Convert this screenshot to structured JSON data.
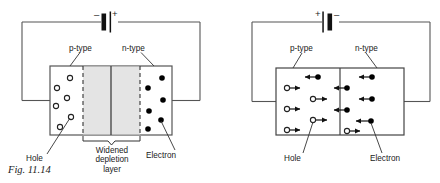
{
  "figure": {
    "caption": "Fig. 11.14",
    "colors": {
      "ink": "#1a1a1a",
      "wire": "#444444",
      "depletion_fill": "#e2e2e2",
      "background": "#ffffff",
      "electron_fill": "#000000",
      "hole_fill": "#ffffff"
    }
  },
  "left_diagram": {
    "name": "reverse-biased-pn-junction",
    "battery": {
      "minus_label": "–",
      "plus_label": "+"
    },
    "labels": {
      "p_type": "p-type",
      "n_type": "n-type",
      "hole": "Hole",
      "electron": "Electron",
      "depletion": "Widened depletion layer",
      "depletion_lines": [
        "Widened",
        "depletion",
        "layer"
      ]
    },
    "holes": [
      {
        "cx": 70,
        "cy": 78
      },
      {
        "cx": 57,
        "cy": 88
      },
      {
        "cx": 67,
        "cy": 98
      },
      {
        "cx": 56,
        "cy": 106
      },
      {
        "cx": 71,
        "cy": 117
      },
      {
        "cx": 60,
        "cy": 127
      }
    ],
    "electrons": [
      {
        "cx": 162,
        "cy": 78
      },
      {
        "cx": 148,
        "cy": 88
      },
      {
        "cx": 163,
        "cy": 100
      },
      {
        "cx": 149,
        "cy": 111
      },
      {
        "cx": 161,
        "cy": 120
      },
      {
        "cx": 148,
        "cy": 129
      }
    ],
    "device": {
      "x": 50,
      "y": 66,
      "w": 122,
      "h": 69
    },
    "depletion": {
      "x1": 83,
      "x2": 140,
      "junction_x": 111
    }
  },
  "right_diagram": {
    "name": "forward-biased-pn-junction",
    "battery": {
      "plus_label": "+",
      "minus_label": "–"
    },
    "labels": {
      "p_type": "p-type",
      "n_type": "n-type",
      "hole": "Hole",
      "electron": "Electron"
    },
    "device": {
      "x": 276,
      "y": 68,
      "w": 128,
      "h": 67
    },
    "junction_x": 340,
    "carriers": [
      {
        "type": "electron",
        "dir": "left",
        "x": 318,
        "y": 77
      },
      {
        "type": "hole",
        "dir": "right",
        "x": 287,
        "y": 88
      },
      {
        "type": "hole",
        "dir": "right",
        "x": 313,
        "y": 99
      },
      {
        "type": "hole",
        "dir": "right",
        "x": 287,
        "y": 109
      },
      {
        "type": "hole",
        "dir": "right",
        "x": 313,
        "y": 120
      },
      {
        "type": "hole",
        "dir": "right",
        "x": 287,
        "y": 130
      },
      {
        "type": "electron",
        "dir": "left",
        "x": 372,
        "y": 77
      },
      {
        "type": "electron",
        "dir": "left",
        "x": 347,
        "y": 88
      },
      {
        "type": "electron",
        "dir": "left",
        "x": 372,
        "y": 99
      },
      {
        "type": "electron",
        "dir": "left",
        "x": 347,
        "y": 110
      },
      {
        "type": "electron",
        "dir": "left",
        "x": 371,
        "y": 121
      },
      {
        "type": "hole",
        "dir": "right",
        "x": 347,
        "y": 131
      }
    ]
  }
}
